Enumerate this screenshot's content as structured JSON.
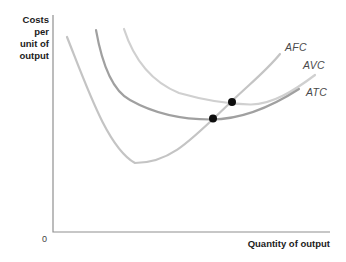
{
  "figure": {
    "ylabel": "Costs\nper\nunit of\noutput",
    "xlabel": "Quantity of output",
    "origin_label": "0"
  },
  "chart_data": {
    "type": "line",
    "title": "",
    "xlabel": "Quantity of output",
    "ylabel": "Costs per unit of output",
    "legend": "none (curves labeled at line ends)",
    "axes": {
      "numeric_ticks": false,
      "grid": false,
      "polyline": "53,15 53,232 330,232",
      "color": "#909090",
      "origin_label": "0",
      "coordinate_space": "image pixels (346x262, y down)"
    },
    "series": [
      {
        "name": "AFC",
        "color": "#c4c4c4",
        "shape": "steep U-curve: falls sharply, bottoms out, rises steeply through both intersection dots",
        "path": "M 67 37 C 88 90 108 148 135 163 C 171 163 191 140 232 101 C 252 82 267 70 280 54",
        "points_px": [
          [
            67,
            37
          ],
          [
            93,
            93
          ],
          [
            112,
            133
          ],
          [
            135,
            163
          ],
          [
            165,
            160
          ],
          [
            190,
            138
          ],
          [
            213,
            118
          ],
          [
            232,
            101
          ],
          [
            256,
            79
          ],
          [
            280,
            54
          ]
        ],
        "label_pos": {
          "x": 285,
          "y": 41
        }
      },
      {
        "name": "AVC",
        "color": "#d0d0d0",
        "shape": "shallow U-curve, upper of the two flat curves; minimum near right intersection dot",
        "path": "M 124 29 C 134 60 152 82 179 93 C 200 99 225 104 250 104.5 C 272 105 295 90 315 75",
        "points_px": [
          [
            124,
            29
          ],
          [
            145,
            68
          ],
          [
            166,
            87
          ],
          [
            190,
            97
          ],
          [
            213,
            101
          ],
          [
            232,
            103
          ],
          [
            250,
            104
          ],
          [
            270,
            103
          ],
          [
            292,
            92
          ],
          [
            315,
            75
          ]
        ],
        "label_pos": {
          "x": 303,
          "y": 59
        }
      },
      {
        "name": "ATC",
        "color": "#a0a0a0",
        "shape": "shallow U-curve, lower/darker curve; minimum at left intersection dot",
        "path": "M 96 30 C 102 64 113 91 130 100 C 153 113 180 119.5 211 119.5 C 242 119.5 271 107 299 89",
        "points_px": [
          [
            96,
            30
          ],
          [
            104,
            68
          ],
          [
            118,
            94
          ],
          [
            135,
            103
          ],
          [
            160,
            112
          ],
          [
            185,
            117
          ],
          [
            211,
            119
          ],
          [
            235,
            118
          ],
          [
            260,
            112
          ],
          [
            280,
            102
          ],
          [
            299,
            89
          ]
        ],
        "label_pos": {
          "x": 306,
          "y": 86
        }
      }
    ],
    "markers": [
      {
        "x": 213,
        "y": 118.5,
        "r": 4,
        "color": "#0d0d0d",
        "note": "dot where steep curve crosses darker (ATC-labeled) curve"
      },
      {
        "x": 232,
        "y": 102,
        "r": 4,
        "color": "#0d0d0d",
        "note": "dot where steep curve crosses lighter (AVC-labeled) curve"
      }
    ]
  }
}
